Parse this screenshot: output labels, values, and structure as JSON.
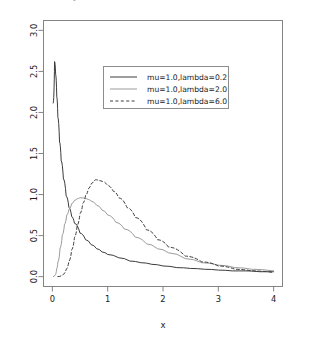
{
  "figure": {
    "clipped_top_text": "density of x",
    "background_color": "#ffffff",
    "frame_color": "#848484"
  },
  "chart_data": {
    "type": "line",
    "title": "",
    "xlabel": "x",
    "ylabel": "",
    "xlim": [
      -0.16,
      4.16
    ],
    "ylim": [
      -0.12,
      3.12
    ],
    "xticks": [
      0,
      1,
      2,
      3,
      4
    ],
    "xtick_labels": [
      "0",
      "1",
      "2",
      "3",
      "4"
    ],
    "yticks": [
      0.0,
      0.5,
      1.0,
      1.5,
      2.0,
      2.5,
      3.0
    ],
    "ytick_labels": [
      "0.0",
      "0.5",
      "1.0",
      "1.5",
      "2.0",
      "2.5",
      "3.0"
    ],
    "grid": false,
    "legend_position": "upper center",
    "series": [
      {
        "name": "mu=1.0,lambda=0.2",
        "color": "#3c3c3c",
        "linestyle": "solid",
        "linewidth": 1.0,
        "peak": {
          "x": 0.04,
          "y": 2.62
        },
        "x": [
          0.02,
          0.04,
          0.06,
          0.08,
          0.1,
          0.13,
          0.16,
          0.2,
          0.25,
          0.3,
          0.35,
          0.4,
          0.5,
          0.6,
          0.7,
          0.8,
          0.9,
          1.0,
          1.2,
          1.4,
          1.6,
          1.8,
          2.0,
          2.25,
          2.5,
          2.75,
          3.0,
          3.25,
          3.5,
          3.75,
          4.0
        ],
        "y": [
          2.11,
          2.62,
          2.46,
          2.19,
          1.94,
          1.64,
          1.41,
          1.19,
          0.98,
          0.84,
          0.73,
          0.65,
          0.53,
          0.45,
          0.39,
          0.34,
          0.3,
          0.27,
          0.23,
          0.19,
          0.17,
          0.15,
          0.13,
          0.11,
          0.1,
          0.09,
          0.08,
          0.07,
          0.07,
          0.06,
          0.06
        ]
      },
      {
        "name": "mu=1.0,lambda=2.0",
        "color": "#9c9c9c",
        "linestyle": "solid",
        "linewidth": 1.0,
        "peak": {
          "x": 0.54,
          "y": 0.96
        },
        "x": [
          0.02,
          0.05,
          0.08,
          0.1,
          0.14,
          0.18,
          0.22,
          0.26,
          0.3,
          0.35,
          0.4,
          0.45,
          0.5,
          0.54,
          0.6,
          0.65,
          0.7,
          0.8,
          0.9,
          1.0,
          1.15,
          1.3,
          1.5,
          1.7,
          1.9,
          2.1,
          2.4,
          2.7,
          3.0,
          3.3,
          3.6,
          4.0
        ],
        "y": [
          0.0,
          0.02,
          0.1,
          0.18,
          0.35,
          0.51,
          0.64,
          0.75,
          0.82,
          0.89,
          0.93,
          0.95,
          0.96,
          0.96,
          0.95,
          0.94,
          0.92,
          0.87,
          0.81,
          0.75,
          0.66,
          0.58,
          0.48,
          0.4,
          0.34,
          0.29,
          0.22,
          0.17,
          0.14,
          0.11,
          0.09,
          0.07
        ]
      },
      {
        "name": "mu=1.0,lambda=6.0",
        "color": "#3c3c3c",
        "linestyle": "dashed",
        "linewidth": 1.0,
        "peak": {
          "x": 0.78,
          "y": 1.18
        },
        "x": [
          0.1,
          0.16,
          0.2,
          0.25,
          0.3,
          0.35,
          0.4,
          0.45,
          0.5,
          0.55,
          0.6,
          0.65,
          0.7,
          0.75,
          0.78,
          0.85,
          0.9,
          1.0,
          1.1,
          1.2,
          1.35,
          1.5,
          1.7,
          1.9,
          2.1,
          2.4,
          2.7,
          3.0,
          3.3,
          3.6,
          4.0
        ],
        "y": [
          0.0,
          0.01,
          0.03,
          0.09,
          0.19,
          0.33,
          0.48,
          0.63,
          0.77,
          0.89,
          0.99,
          1.07,
          1.13,
          1.17,
          1.18,
          1.17,
          1.16,
          1.11,
          1.04,
          0.96,
          0.84,
          0.72,
          0.57,
          0.45,
          0.36,
          0.25,
          0.18,
          0.13,
          0.09,
          0.07,
          0.05
        ]
      }
    ]
  },
  "legend": {
    "items": [
      {
        "label": "mu=1.0,lambda=0.2",
        "style": "solid",
        "color": "#3c3c3c"
      },
      {
        "label": "mu=1.0,lambda=2.0",
        "style": "solid",
        "color": "#9c9c9c"
      },
      {
        "label": "mu=1.0,lambda=6.0",
        "style": "dashed",
        "color": "#3c3c3c"
      }
    ]
  }
}
